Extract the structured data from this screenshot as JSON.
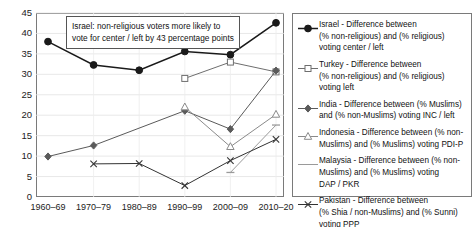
{
  "chart_data": {
    "type": "line",
    "title": "",
    "subtitle": "",
    "xlabel": "",
    "ylabel": "",
    "categories": [
      "1960–69",
      "1970–79",
      "1980–89",
      "1990–99",
      "2000–09",
      "2010–20"
    ],
    "ylim": [
      0,
      45
    ],
    "yticks": [
      0,
      5,
      10,
      15,
      20,
      25,
      30,
      35,
      40,
      45
    ],
    "grid": true,
    "legend_position": "right",
    "annotations": [
      {
        "name": "israel-callout",
        "line1": "Israel: non-religious voters more likely to",
        "line2": "vote for center / left by 43 percentage points"
      }
    ],
    "series": [
      {
        "name": "Israel",
        "legend_label_line1": "Israel - Difference between",
        "legend_label_line2": "(% non-religious) and (% religious)",
        "legend_label_line3": "voting center / left",
        "marker": "filled-circle",
        "color": "#1a1a1a",
        "values": [
          38.0,
          32.3,
          31.0,
          35.6,
          34.8,
          42.6
        ]
      },
      {
        "name": "Turkey",
        "legend_label_line1": "Turkey - Difference between",
        "legend_label_line2": "(% non-religious) and (% religious)",
        "legend_label_line3": "voting left",
        "marker": "open-square",
        "color": "#6e6e6e",
        "values": [
          null,
          null,
          null,
          29.0,
          33.0,
          30.6
        ]
      },
      {
        "name": "India",
        "legend_label_line1": "India - Difference between (% Muslims)",
        "legend_label_line2": "and (% non-Muslims) voting INC / left",
        "legend_label_line3": "",
        "marker": "filled-diamond",
        "color": "#5a5a5a",
        "values": [
          9.9,
          12.6,
          null,
          21.1,
          16.6,
          30.9
        ]
      },
      {
        "name": "Indonesia",
        "legend_label_line1": "Indonesia - Difference between (% non-",
        "legend_label_line2": "Muslims) and (% Muslims) voting PDI-P",
        "legend_label_line3": "",
        "marker": "open-triangle",
        "color": "#8a8a8a",
        "values": [
          null,
          null,
          null,
          22.0,
          12.3,
          20.2
        ]
      },
      {
        "name": "Malaysia",
        "legend_label_line1": "Malaysia - Difference between (% non-",
        "legend_label_line2": "Muslims) and (% Muslims) voting",
        "legend_label_line3": "DAP / PKR",
        "marker": "plain-line",
        "color": "#9a9a9a",
        "values": [
          null,
          null,
          null,
          null,
          6.0,
          17.6
        ]
      },
      {
        "name": "Pakistan",
        "legend_label_line1": "Pakistan - Difference between",
        "legend_label_line2": "(% Shia / non-Muslims) and (% Sunni)",
        "legend_label_line3": "voting PPP",
        "marker": "cross-x",
        "color": "#333333",
        "values": [
          null,
          8.1,
          8.2,
          2.8,
          8.9,
          14.1
        ]
      }
    ]
  }
}
